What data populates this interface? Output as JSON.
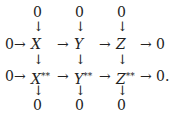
{
  "diagram": {
    "type": "commutative-diagram",
    "top_zeros": [
      "0",
      "0",
      "0"
    ],
    "row1": {
      "left": "0",
      "nodes": [
        "X",
        "Y",
        "Z"
      ],
      "right": "0",
      "arrow": "→"
    },
    "row2": {
      "left": "0",
      "nodes": [
        "X",
        "Y",
        "Z"
      ],
      "superscript": "**",
      "right": "0.",
      "arrow": "→"
    },
    "bottom_zeros": [
      "0",
      "0",
      "0"
    ],
    "down_arrow": "↓"
  }
}
